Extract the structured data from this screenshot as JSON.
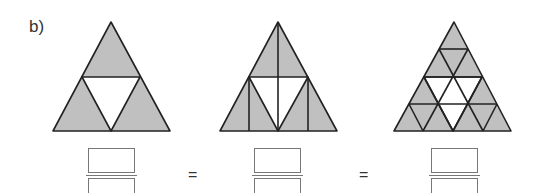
{
  "exercise": {
    "label": "b)",
    "equals_sign": "=",
    "colors": {
      "shaded": "#c0c0c0",
      "unshaded": "#ffffff",
      "stroke": "#222222",
      "box_border": "#777777"
    },
    "figures": [
      {
        "name": "triangle-4-parts",
        "total_parts": 4,
        "shaded_parts": 3
      },
      {
        "name": "triangle-8-parts",
        "total_parts": 8,
        "shaded_parts": 6
      },
      {
        "name": "triangle-16-parts",
        "total_parts": 16,
        "shaded_parts": 12
      }
    ],
    "fractions": [
      {
        "numerator": "",
        "denominator": ""
      },
      {
        "numerator": "",
        "denominator": ""
      },
      {
        "numerator": "",
        "denominator": ""
      }
    ]
  }
}
